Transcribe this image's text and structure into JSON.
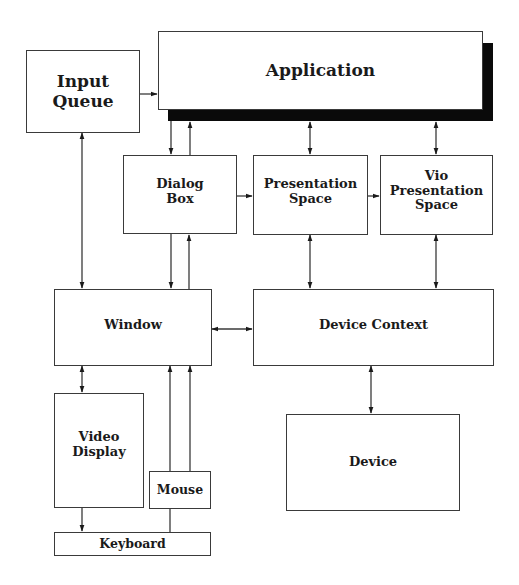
{
  "diagram": {
    "type": "block-diagram",
    "colors": {
      "line": "#3a3a3a",
      "shadow": "#0a0a0a",
      "background": "#ffffff",
      "text": "#1a1a1a"
    },
    "nodes": {
      "application": {
        "label": "Application"
      },
      "input_queue": {
        "label": "Input Queue"
      },
      "dialog_box": {
        "label": "Dialog\nBox"
      },
      "presentation_space": {
        "label": "Presentation\nSpace"
      },
      "vio_presentation_space": {
        "label": "Vio\nPresentation\nSpace"
      },
      "window": {
        "label": "Window"
      },
      "device_context": {
        "label": "Device  Context"
      },
      "video_display": {
        "label": "Video\nDisplay"
      },
      "mouse": {
        "label": "Mouse"
      },
      "keyboard": {
        "label": "Keyboard"
      },
      "device": {
        "label": "Device"
      }
    },
    "edges": [
      {
        "from": "Input Queue",
        "to": "Application",
        "direction": "one-way"
      },
      {
        "from": "Input Queue",
        "to": "Window",
        "direction": "two-way"
      },
      {
        "from": "Application",
        "to": "Dialog Box",
        "direction": "one-way"
      },
      {
        "from": "Dialog Box",
        "to": "Application",
        "direction": "one-way"
      },
      {
        "from": "Application",
        "to": "Presentation Space",
        "direction": "two-way"
      },
      {
        "from": "Application",
        "to": "Vio Presentation Space",
        "direction": "two-way"
      },
      {
        "from": "Dialog Box",
        "to": "Presentation Space",
        "direction": "one-way"
      },
      {
        "from": "Presentation Space",
        "to": "Vio Presentation Space",
        "direction": "one-way"
      },
      {
        "from": "Dialog Box",
        "to": "Window",
        "direction": "one-way"
      },
      {
        "from": "Window",
        "to": "Dialog Box",
        "direction": "one-way"
      },
      {
        "from": "Presentation Space",
        "to": "Device Context",
        "direction": "two-way"
      },
      {
        "from": "Vio Presentation Space",
        "to": "Device Context",
        "direction": "two-way"
      },
      {
        "from": "Window",
        "to": "Device Context",
        "direction": "two-way"
      },
      {
        "from": "Window",
        "to": "Video Display",
        "direction": "two-way"
      },
      {
        "from": "Mouse",
        "to": "Window",
        "direction": "one-way"
      },
      {
        "from": "Keyboard",
        "to": "Window",
        "direction": "one-way"
      },
      {
        "from": "Video Display",
        "to": "Keyboard",
        "direction": "one-way"
      },
      {
        "from": "Device Context",
        "to": "Device",
        "direction": "two-way"
      }
    ]
  }
}
